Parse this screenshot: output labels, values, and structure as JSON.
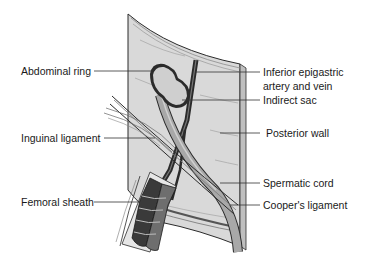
{
  "figure": {
    "type": "anatomical illustration",
    "colors": {
      "wall_fill": "#d9d9d9",
      "wall_edge": "#8c8c8c",
      "outline": "#2b2b2b",
      "sac_fill": "#cfcfcf",
      "cord_fill": "#a8a8a8",
      "vessel_dark": "#3a3a3a",
      "vein_fill": "#6e6e6e",
      "leader": "#333333"
    }
  },
  "labels": {
    "abdominal_ring": "Abdominal ring",
    "inferior_epigastric_1": "Inferior epigastric",
    "inferior_epigastric_2": "artery and vein",
    "indirect_sac": "Indirect sac",
    "posterior_wall": "Posterior wall",
    "inguinal_ligament": "Inguinal ligament",
    "spermatic_cord": "Spermatic cord",
    "femoral_sheath": "Femoral sheath",
    "coopers_ligament": "Cooper's ligament"
  }
}
